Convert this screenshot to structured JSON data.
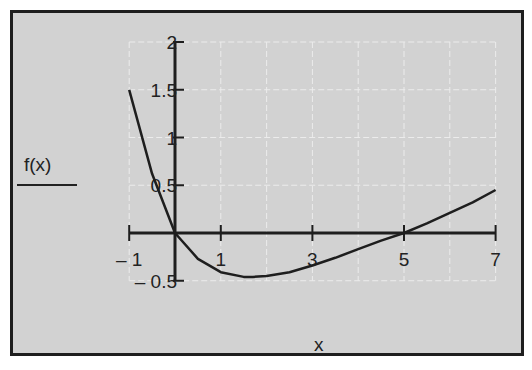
{
  "chart_data": {
    "type": "line",
    "title": "",
    "xlabel": "x",
    "ylabel": "f(x)",
    "xlim": [
      -1,
      7
    ],
    "ylim": [
      -0.5,
      2
    ],
    "x_ticks": [
      "-1",
      "1",
      "3",
      "5",
      "7"
    ],
    "y_ticks": [
      "-0.5",
      "0.5",
      "1",
      "1.5",
      "2"
    ],
    "grid": true,
    "series": [
      {
        "name": "f(x)",
        "x": [
          -1,
          -0.5,
          0,
          0.5,
          1,
          1.5,
          1.7,
          2,
          2.5,
          3,
          3.5,
          4,
          4.5,
          5,
          5.5,
          6,
          6.5,
          7
        ],
        "y": [
          1.5,
          0.62,
          0.0,
          -0.27,
          -0.41,
          -0.46,
          -0.46,
          -0.45,
          -0.41,
          -0.34,
          -0.26,
          -0.17,
          -0.08,
          0.0,
          0.1,
          0.21,
          0.32,
          0.45
        ]
      }
    ]
  },
  "labels": {
    "ylabel": "f(x)",
    "xlabel": "x"
  },
  "colors": {
    "background": "#d2d2d2",
    "line": "#1e1e1e",
    "grid": "#ececec"
  }
}
